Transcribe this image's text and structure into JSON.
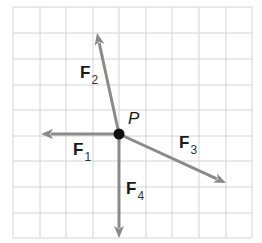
{
  "diagram": {
    "grid": {
      "x_lines": [
        13,
        40,
        66,
        93,
        119,
        146,
        172,
        199,
        226,
        252
      ],
      "y_lines": [
        7,
        33,
        59,
        85,
        110,
        136,
        161,
        187,
        213,
        238
      ],
      "color": "#d4d4d4"
    },
    "point": {
      "label": "P",
      "x": 119,
      "y": 134,
      "color": "#111111"
    },
    "arrow_color": "#8a8a8a",
    "vectors": [
      {
        "name": "F",
        "sub": "1",
        "tip": [
          41,
          134
        ],
        "label_pos": [
          73,
          141
        ]
      },
      {
        "name": "F",
        "sub": "2",
        "tip": [
          97,
          33
        ],
        "label_pos": [
          80,
          64
        ]
      },
      {
        "name": "F",
        "sub": "3",
        "tip": [
          226,
          183
        ],
        "label_pos": [
          179,
          134
        ]
      },
      {
        "name": "F",
        "sub": "4",
        "tip": [
          119,
          238
        ],
        "label_pos": [
          126,
          180
        ]
      }
    ]
  }
}
